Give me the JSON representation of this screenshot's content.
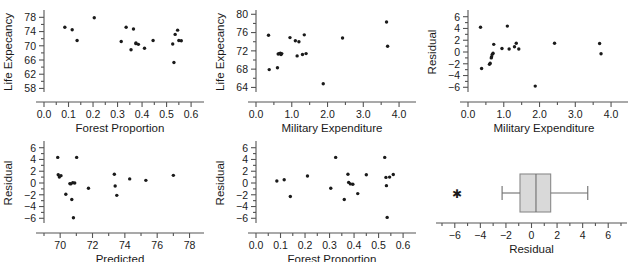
{
  "figure": {
    "title": "",
    "panel_count": 6
  },
  "chart_data": [
    {
      "id": "p1",
      "type": "scatter",
      "title": "",
      "xlabel": "Forest Proportion",
      "ylabel": "Life Expecancy",
      "xlim": [
        0.0,
        0.62
      ],
      "ylim": [
        57.0,
        79.5
      ],
      "xticks": [
        0.0,
        0.1,
        0.2,
        0.3,
        0.4,
        0.5,
        0.6
      ],
      "xticklabels": [
        "0.0",
        "0.1",
        "0.2",
        "0.3",
        "0.4",
        "0.5",
        "0.6"
      ],
      "yticks": [
        58,
        62,
        66,
        70,
        74,
        78
      ],
      "yticklabels": [
        "58",
        "62",
        "66",
        "70",
        "74",
        "78"
      ],
      "minor_ticks": true,
      "grid": false,
      "x": [
        0.085,
        0.115,
        0.135,
        0.205,
        0.315,
        0.335,
        0.355,
        0.365,
        0.375,
        0.385,
        0.41,
        0.445,
        0.525,
        0.53,
        0.535,
        0.545,
        0.55,
        0.56,
        0.375
      ],
      "y": [
        75.2,
        74.5,
        71.5,
        77.9,
        71.2,
        75.2,
        68.9,
        74.7,
        70.8,
        70.4,
        69.3,
        71.5,
        70.5,
        65.3,
        73.2,
        74.4,
        71.5,
        71.4,
        70.6
      ]
    },
    {
      "id": "p2",
      "type": "scatter",
      "title": "",
      "xlabel": "Military Expenditure",
      "ylabel": "Life Expecancy",
      "xlim": [
        0.0,
        4.25
      ],
      "ylim": [
        63.0,
        80.5
      ],
      "xticks": [
        0.0,
        1.0,
        2.0,
        3.0,
        4.0
      ],
      "xticklabels": [
        "0.0",
        "1.0",
        "2.0",
        "3.0",
        "4.0"
      ],
      "yticks": [
        64,
        68,
        72,
        76,
        80
      ],
      "yticklabels": [
        "64",
        "68",
        "72",
        "76",
        "80"
      ],
      "minor_ticks": true,
      "grid": false,
      "x": [
        0.35,
        0.37,
        0.6,
        0.62,
        0.68,
        0.7,
        0.72,
        0.95,
        1.1,
        1.15,
        1.2,
        1.3,
        1.35,
        1.4,
        1.88,
        2.42,
        3.65,
        3.68,
        0.65
      ],
      "y": [
        75.4,
        67.9,
        68.3,
        71.3,
        71.5,
        71.2,
        71.4,
        74.9,
        74.2,
        70.9,
        74.0,
        71.2,
        75.5,
        71.4,
        64.8,
        74.8,
        78.3,
        73.0,
        71.4
      ]
    },
    {
      "id": "p3",
      "type": "scatter",
      "title": "",
      "xlabel": "Military Expenditure",
      "ylabel": "Residual",
      "xlim": [
        0.0,
        4.25
      ],
      "ylim": [
        -6.8,
        6.8
      ],
      "xticks": [
        0.0,
        1.0,
        2.0,
        3.0,
        4.0
      ],
      "xticklabels": [
        "0.0",
        "1.0",
        "2.0",
        "3.0",
        "4.0"
      ],
      "yticks": [
        -6,
        -4,
        -2,
        0,
        2,
        4,
        6
      ],
      "yticklabels": [
        "−6",
        "−4",
        "−2",
        "0",
        "2",
        "4",
        "6"
      ],
      "minor_ticks": true,
      "grid": false,
      "x": [
        0.35,
        0.38,
        0.6,
        0.62,
        0.65,
        0.66,
        0.68,
        0.7,
        0.72,
        0.95,
        1.1,
        1.15,
        1.3,
        1.35,
        1.42,
        1.88,
        2.42,
        3.68,
        3.72
      ],
      "y": [
        4.2,
        -2.8,
        -2.1,
        -1.9,
        -1.0,
        -0.8,
        -0.4,
        -0.2,
        1.3,
        0.6,
        4.4,
        0.5,
        0.9,
        1.5,
        0.5,
        -5.8,
        1.5,
        1.45,
        -0.3
      ]
    },
    {
      "id": "p4",
      "type": "scatter",
      "title": "",
      "xlabel": "Predicted",
      "ylabel": "Residual",
      "xlim": [
        69.0,
        78.4
      ],
      "ylim": [
        -6.8,
        6.8
      ],
      "xticks": [
        70,
        72,
        74,
        76,
        78
      ],
      "xticklabels": [
        "70",
        "72",
        "74",
        "76",
        "78"
      ],
      "yticks": [
        -6,
        -4,
        -2,
        0,
        2,
        4,
        6
      ],
      "yticklabels": [
        "−6",
        "−4",
        "−2",
        "0",
        "2",
        "4",
        "6"
      ],
      "minor_ticks": true,
      "grid": false,
      "x": [
        69.85,
        69.88,
        69.95,
        70.05,
        70.35,
        70.6,
        70.72,
        70.78,
        70.82,
        70.9,
        71.02,
        71.75,
        73.35,
        73.4,
        73.5,
        74.3,
        75.3,
        77.0,
        70.65
      ],
      "y": [
        4.35,
        1.4,
        1.0,
        1.25,
        -1.9,
        -0.1,
        -2.8,
        0.05,
        -5.9,
        0.0,
        4.35,
        -0.9,
        1.5,
        -0.5,
        -2.1,
        0.7,
        0.45,
        1.3,
        -0.15
      ]
    },
    {
      "id": "p5",
      "type": "scatter",
      "title": "",
      "xlabel": "Forest Proportion",
      "ylabel": "Residual",
      "xlim": [
        0.0,
        0.62
      ],
      "ylim": [
        -6.8,
        6.8
      ],
      "xticks": [
        0.0,
        0.1,
        0.2,
        0.3,
        0.4,
        0.5,
        0.6
      ],
      "xticklabels": [
        "0.0",
        "0.1",
        "0.2",
        "0.3",
        "0.4",
        "0.5",
        "0.6"
      ],
      "yticks": [
        -6,
        -4,
        -2,
        0,
        2,
        4,
        6
      ],
      "yticklabels": [
        "−6",
        "−4",
        "−2",
        "0",
        "2",
        "4",
        "6"
      ],
      "minor_ticks": true,
      "grid": false,
      "x": [
        0.085,
        0.115,
        0.14,
        0.21,
        0.305,
        0.325,
        0.36,
        0.375,
        0.378,
        0.395,
        0.415,
        0.45,
        0.525,
        0.53,
        0.532,
        0.545,
        0.56,
        0.385,
        0.535
      ],
      "y": [
        0.35,
        0.55,
        -2.3,
        1.2,
        -0.9,
        4.35,
        -2.8,
        1.5,
        0.1,
        -0.2,
        -1.8,
        1.4,
        4.35,
        0.95,
        -0.45,
        1.0,
        1.45,
        -0.15,
        -5.85
      ]
    },
    {
      "id": "p6",
      "type": "boxplot",
      "title": "",
      "xlabel": "Residual",
      "ylabel": "",
      "xlim": [
        -7.0,
        7.0
      ],
      "xticks": [
        -6,
        -4,
        -2,
        0,
        2,
        4,
        6
      ],
      "xticklabels": [
        "−6",
        "−4",
        "−2",
        "0",
        "2",
        "4",
        "6"
      ],
      "minor_ticks": true,
      "grid": false,
      "orientation": "horizontal",
      "box": {
        "whisker_low": -2.3,
        "q1": -0.9,
        "median": 0.35,
        "q3": 1.5,
        "whisker_high": 4.4
      },
      "outliers": [
        -5.85
      ],
      "outlier_marker": "asterisk"
    }
  ]
}
